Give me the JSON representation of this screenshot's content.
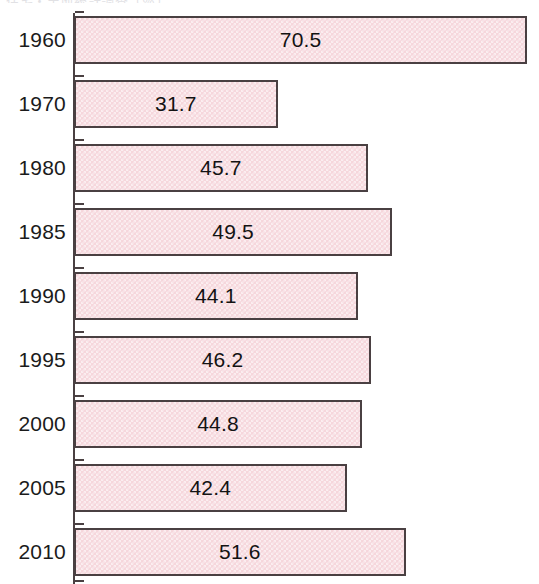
{
  "clipped_title_fragment": "住宅・土地統計調査（％）",
  "colors": {
    "bar_fill": "#f6d7dc",
    "bar_border": "#4a4042",
    "axis": "#4a4042",
    "label_text": "#1b1b1b",
    "background": "#ffffff"
  },
  "chart_data": {
    "type": "bar",
    "orientation": "horizontal",
    "title": "",
    "xlabel": "",
    "ylabel": "",
    "categories": [
      "1960",
      "1970",
      "1980",
      "1985",
      "1990",
      "1995",
      "2000",
      "2005",
      "2010"
    ],
    "values": [
      70.5,
      31.7,
      45.7,
      49.5,
      44.1,
      46.2,
      44.8,
      42.4,
      51.6
    ],
    "value_labels": [
      "70.5",
      "31.7",
      "45.7",
      "49.5",
      "44.1",
      "46.2",
      "44.8",
      "42.4",
      "51.6"
    ],
    "xlim": [
      0,
      70.5
    ],
    "grid": false,
    "legend": null,
    "bars": [
      {
        "category": "1960",
        "value": 70.5,
        "label": "70.5"
      },
      {
        "category": "1970",
        "value": 31.7,
        "label": "31.7"
      },
      {
        "category": "1980",
        "value": 45.7,
        "label": "45.7"
      },
      {
        "category": "1985",
        "value": 49.5,
        "label": "49.5"
      },
      {
        "category": "1990",
        "value": 44.1,
        "label": "44.1"
      },
      {
        "category": "1995",
        "value": 46.2,
        "label": "46.2"
      },
      {
        "category": "2000",
        "value": 44.8,
        "label": "44.8"
      },
      {
        "category": "2005",
        "value": 42.4,
        "label": "42.4"
      },
      {
        "category": "2010",
        "value": 51.6,
        "label": "51.6"
      }
    ]
  }
}
